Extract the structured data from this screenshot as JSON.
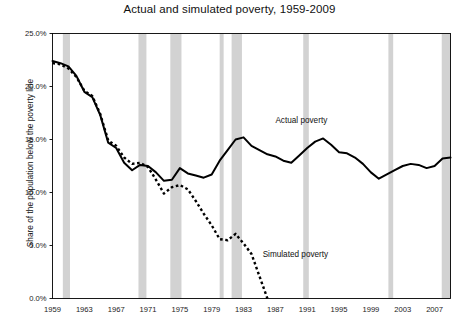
{
  "chart_data": {
    "type": "line",
    "title": "Actual and simulated poverty, 1959-2009",
    "xlabel": "",
    "ylabel": "Share of the population below the poverty line",
    "xlim": [
      1959,
      2009
    ],
    "ylim": [
      0,
      25
    ],
    "ytick_values": [
      0,
      5,
      10,
      15,
      20,
      25
    ],
    "ytick_labels": [
      "0.0%",
      "5.0%",
      "10.0%",
      "15.0%",
      "20.0%",
      "25.0%"
    ],
    "xtick_values": [
      1959,
      1963,
      1967,
      1971,
      1975,
      1979,
      1983,
      1987,
      1991,
      1995,
      1999,
      2003,
      2007
    ],
    "xtick_labels": [
      "1959",
      "1963",
      "1967",
      "1971",
      "1975",
      "1979",
      "1983",
      "1987",
      "1991",
      "1995",
      "1999",
      "2003",
      "2007"
    ],
    "grid": false,
    "legend_position": "inline-annotation",
    "series": [
      {
        "name": "Actual poverty",
        "style": "solid",
        "color": "#000000",
        "label_x": 1987.0,
        "label_y": 16.6,
        "x": [
          1959,
          1960,
          1961,
          1962,
          1963,
          1964,
          1965,
          1966,
          1967,
          1968,
          1969,
          1970,
          1971,
          1972,
          1973,
          1974,
          1975,
          1976,
          1977,
          1978,
          1979,
          1980,
          1981,
          1982,
          1983,
          1984,
          1985,
          1986,
          1987,
          1988,
          1989,
          1990,
          1991,
          1992,
          1993,
          1994,
          1995,
          1996,
          1997,
          1998,
          1999,
          2000,
          2001,
          2002,
          2003,
          2004,
          2005,
          2006,
          2007,
          2008,
          2009
        ],
        "values": [
          22.4,
          22.2,
          21.9,
          21.0,
          19.5,
          19.0,
          17.3,
          14.7,
          14.2,
          12.8,
          12.1,
          12.6,
          12.5,
          11.9,
          11.1,
          11.2,
          12.3,
          11.8,
          11.6,
          11.4,
          11.7,
          13.0,
          14.0,
          15.0,
          15.2,
          14.4,
          14.0,
          13.6,
          13.4,
          13.0,
          12.8,
          13.5,
          14.2,
          14.8,
          15.1,
          14.5,
          13.8,
          13.7,
          13.3,
          12.7,
          11.9,
          11.3,
          11.7,
          12.1,
          12.5,
          12.7,
          12.6,
          12.3,
          12.5,
          13.2,
          13.3
        ]
      },
      {
        "name": "Simulated poverty",
        "style": "dotted",
        "color": "#000000",
        "label_x": 1985.4,
        "label_y": 3.9,
        "x": [
          1959,
          1960,
          1961,
          1962,
          1963,
          1964,
          1965,
          1966,
          1967,
          1968,
          1969,
          1970,
          1971,
          1972,
          1973,
          1974,
          1975,
          1976,
          1977,
          1978,
          1979,
          1980,
          1981,
          1982,
          1983,
          1984,
          1985,
          1986
        ],
        "values": [
          22.2,
          22.1,
          21.7,
          20.9,
          19.6,
          19.1,
          17.4,
          14.9,
          14.4,
          13.3,
          12.7,
          12.8,
          12.4,
          11.2,
          9.9,
          10.5,
          10.7,
          10.3,
          9.2,
          8.0,
          6.9,
          5.6,
          5.5,
          6.1,
          5.2,
          4.2,
          2.1,
          0.0
        ]
      }
    ],
    "recession_bands": [
      {
        "start": 1960.3,
        "end": 1961.2
      },
      {
        "start": 1969.8,
        "end": 1970.8
      },
      {
        "start": 1973.8,
        "end": 1975.2
      },
      {
        "start": 1980.0,
        "end": 1980.5
      },
      {
        "start": 1981.5,
        "end": 1982.8
      },
      {
        "start": 1990.5,
        "end": 1991.2
      },
      {
        "start": 2001.2,
        "end": 2001.8
      },
      {
        "start": 2007.9,
        "end": 2009.0
      }
    ],
    "band_color": "#d2d2d2"
  }
}
